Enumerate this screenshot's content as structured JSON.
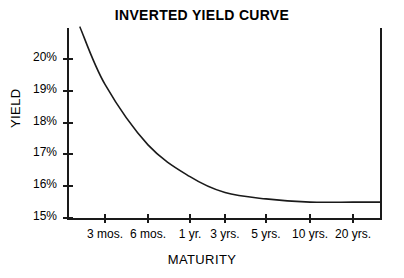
{
  "chart_data": {
    "type": "line",
    "title": "INVERTED YIELD CURVE",
    "xlabel": "MATURITY",
    "ylabel": "YIELD",
    "grid": false,
    "legend": "none",
    "categories": [
      "3 mos.",
      "6 mos.",
      "1 yr.",
      "3 yrs.",
      "5 yrs.",
      "10 yrs.",
      "20 yrs."
    ],
    "x_tick_labels": [
      "3 mos.",
      "6 mos.",
      "1 yr.",
      "3 yrs.",
      "5 yrs.",
      "10 yrs.",
      "20 yrs."
    ],
    "y_tick_labels": [
      "20%",
      "19%",
      "18%",
      "17%",
      "16%",
      "15%"
    ],
    "y_tick_values": [
      20,
      19,
      18,
      17,
      16,
      15
    ],
    "ylim": [
      15,
      21
    ],
    "series": [
      {
        "name": "Yield",
        "values": [
          19.2,
          17.3,
          16.3,
          15.8,
          15.6,
          15.5,
          15.5
        ],
        "units": "percent"
      }
    ],
    "curve_points": [
      {
        "x": "start",
        "yield": 21.0
      },
      {
        "x": "3 mos.",
        "yield": 19.2
      },
      {
        "x": "6 mos.",
        "yield": 17.3
      },
      {
        "x": "1 yr.",
        "yield": 16.3
      },
      {
        "x": "3 yrs.",
        "yield": 15.8
      },
      {
        "x": "5 yrs.",
        "yield": 15.6
      },
      {
        "x": "10 yrs.",
        "yield": 15.5
      },
      {
        "x": "20 yrs.",
        "yield": 15.5
      }
    ],
    "colors": {
      "curve": "#1a1a1a",
      "axis": "#1a1a1a",
      "background": "#ffffff",
      "text": "#000000"
    }
  },
  "y_ticks": [
    {
      "label": "20%"
    },
    {
      "label": "19%"
    },
    {
      "label": "18%"
    },
    {
      "label": "17%"
    },
    {
      "label": "16%"
    },
    {
      "label": "15%"
    }
  ],
  "x_ticks": [
    {
      "label": "3 mos."
    },
    {
      "label": "6 mos."
    },
    {
      "label": "1 yr."
    },
    {
      "label": "3 yrs."
    },
    {
      "label": "5 yrs."
    },
    {
      "label": "10 yrs."
    },
    {
      "label": "20 yrs."
    }
  ]
}
